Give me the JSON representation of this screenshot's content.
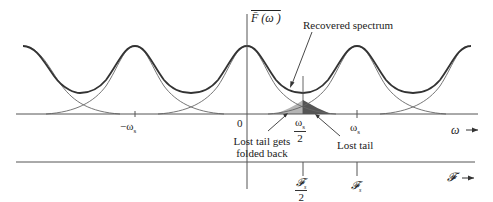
{
  "figure": {
    "y_axis_label": "F̄ (ω )",
    "x_axis_label": "ω",
    "f_axis_label": "𝓕",
    "annotations": {
      "recovered_spectrum": "Recovered spectrum",
      "lost_tail": "Lost tail",
      "lost_tail_folded_line1": "Lost tail gets",
      "lost_tail_folded_line2": "folded back"
    },
    "omega_ticks": {
      "neg_ws": "−ω",
      "neg_ws_sub": "s",
      "zero": "0",
      "half_ws_num": "ω",
      "half_ws_num_sub": "s",
      "half_ws_den": "2",
      "ws": "ω",
      "ws_sub": "s"
    },
    "f_ticks": {
      "half_fs_num": "𝓕",
      "half_fs_num_sub": "s",
      "half_fs_den": "2",
      "fs": "𝓕",
      "fs_sub": "s"
    },
    "colors": {
      "curve": "#333333",
      "axis": "#555555",
      "shade_light": "#b5b5b5",
      "shade_dark": "#555555"
    }
  }
}
